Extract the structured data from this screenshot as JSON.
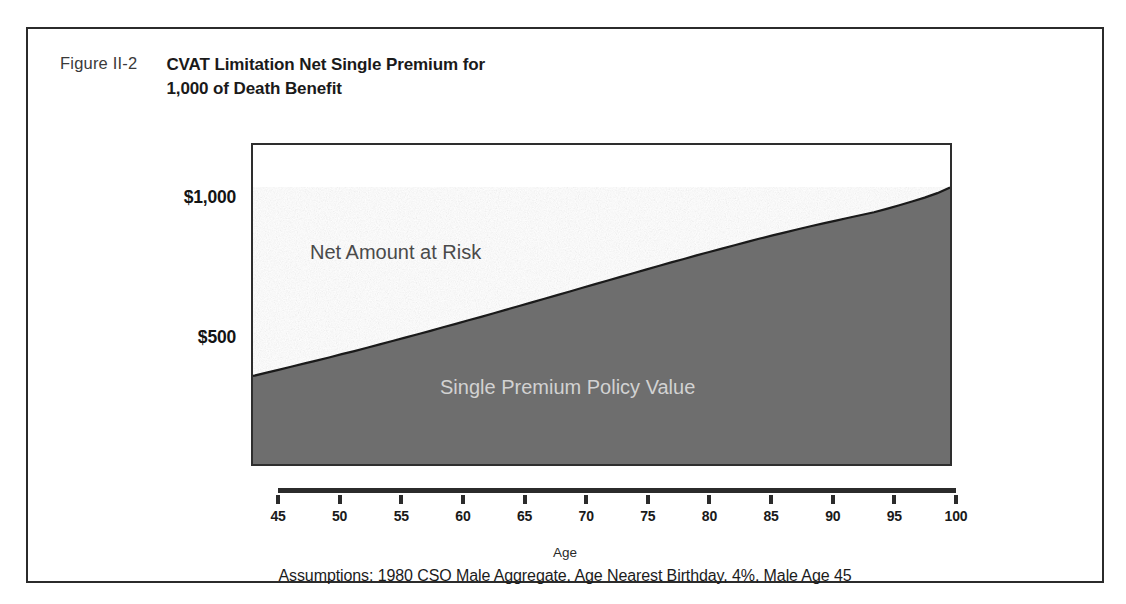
{
  "figure": {
    "number_label": "Figure II-2",
    "title_line1": "CVAT Limitation Net Single Premium for",
    "title_line2": "1,000 of Death Benefit",
    "assumptions": "Assumptions: 1980 CSO Male Aggregate, Age Nearest Birthday, 4%, Male Age 45"
  },
  "annotations": {
    "above_curve": "Net Amount at Risk",
    "below_curve": "Single Premium Policy Value"
  },
  "colors": {
    "fill": "#6e6e6e",
    "curve": "#1a1a1a",
    "frame": "#2b2b2b",
    "above_label": "#4a4a4a",
    "below_label": "#d2d2d2"
  },
  "chart_data": {
    "type": "area",
    "title": "CVAT Limitation Net Single Premium for 1,000 of Death Benefit",
    "subtitle": "Assumptions: 1980 CSO Male Aggregate, Age Nearest Birthday, 4%, Male Age 45",
    "xlabel": "Age",
    "ylabel": "",
    "xlim": [
      45,
      100
    ],
    "ylim": [
      0,
      1075
    ],
    "grid": false,
    "legend": "in-plot annotations",
    "x_ticks": [
      45,
      50,
      55,
      60,
      65,
      70,
      75,
      80,
      85,
      90,
      95,
      100
    ],
    "x_tick_labels": [
      "45",
      "50",
      "55",
      "60",
      "65",
      "70",
      "75",
      "80",
      "85",
      "90",
      "95",
      "100"
    ],
    "y_ticks": [
      500,
      1000
    ],
    "y_tick_labels": [
      "$500",
      "$1,000"
    ],
    "series": [
      {
        "name": "Single Premium Policy Value",
        "x": [
          45,
          46,
          47,
          48,
          49,
          50,
          51,
          52,
          53,
          54,
          55,
          56,
          57,
          58,
          59,
          60,
          61,
          62,
          63,
          64,
          65,
          66,
          67,
          68,
          69,
          70,
          71,
          72,
          73,
          74,
          75,
          76,
          77,
          78,
          79,
          80,
          81,
          82,
          83,
          84,
          85,
          86,
          87,
          88,
          89,
          90,
          91,
          92,
          93,
          94,
          95,
          96,
          97,
          98,
          99,
          100
        ],
        "values": [
          375,
          386,
          397,
          408,
          419,
          430,
          441,
          453,
          464,
          476,
          488,
          500,
          512,
          524,
          536,
          549,
          561,
          574,
          586,
          599,
          612,
          625,
          638,
          651,
          664,
          677,
          690,
          703,
          716,
          729,
          742,
          755,
          768,
          781,
          793,
          806,
          818,
          830,
          842,
          854,
          866,
          877,
          888,
          899,
          910,
          920,
          930,
          940,
          950,
          960,
          972,
          985,
          998,
          1012,
          1028,
          1048
        ]
      }
    ],
    "regions": [
      {
        "name": "Net Amount at Risk",
        "description": "area between the single premium policy value curve and the 1,000 death benefit level"
      },
      {
        "name": "Single Premium Policy Value",
        "description": "shaded area under the curve"
      }
    ]
  }
}
